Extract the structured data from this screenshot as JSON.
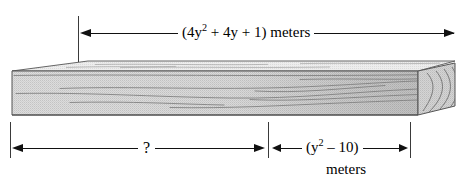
{
  "figure": {
    "top_dimension": {
      "label_html": "(4y<sup>2</sup> + 4y + 1) meters",
      "label_text": "(4y² + 4y + 1) meters",
      "expression": "4y^2 + 4y + 1",
      "unit": "meters"
    },
    "bottom_left_dimension": {
      "label_text": "?",
      "expression": "unknown",
      "unit": ""
    },
    "bottom_right_dimension": {
      "label_html": "(y<sup>2</sup> &#8211; 10)",
      "label_text": "(y² – 10)",
      "unit_text": "meters",
      "expression": "y^2 - 10"
    }
  },
  "colors": {
    "line": "#111111",
    "tick": "#3a3a3a",
    "board_face": "#d8d8d8",
    "board_top": "#e8e8e8",
    "board_end": "#cfcfcf",
    "board_outline": "#555555",
    "grain": "#8a8a8a",
    "background": "#ffffff"
  }
}
